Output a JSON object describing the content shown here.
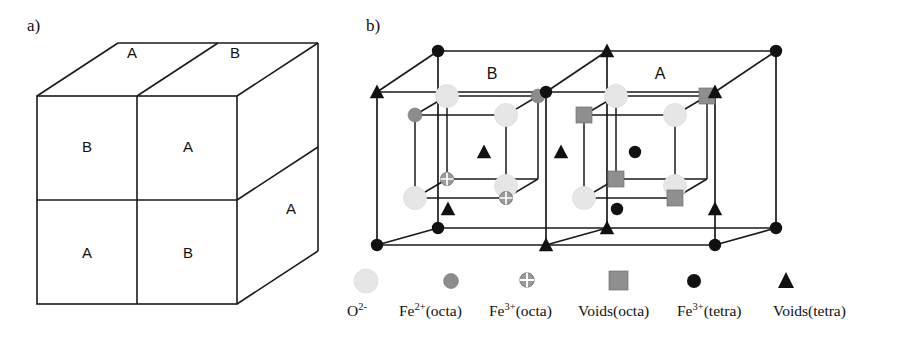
{
  "figure": {
    "panels": [
      {
        "id": "a",
        "label": "a)"
      },
      {
        "id": "b",
        "label": "b)"
      }
    ]
  },
  "panel_a": {
    "label": "a)",
    "description": "stacked-cube-block-diagram",
    "faces": [
      {
        "name": "top-left",
        "label": "A"
      },
      {
        "name": "top-right",
        "label": "B"
      },
      {
        "name": "front-upper-left",
        "label": "B"
      },
      {
        "name": "front-upper-right",
        "label": "A"
      },
      {
        "name": "front-lower-left",
        "label": "A"
      },
      {
        "name": "front-lower-right",
        "label": "B"
      },
      {
        "name": "side-lower",
        "label": "A"
      }
    ]
  },
  "panel_b": {
    "label": "b)",
    "description": "spinel-unit-cell-lattice",
    "region_labels": [
      {
        "name": "left-subcell",
        "label": "B"
      },
      {
        "name": "right-subcell",
        "label": "A"
      }
    ],
    "interior_markers": [
      {
        "name": "voids-tetra-1",
        "symbol": "triangle"
      },
      {
        "name": "voids-tetra-2",
        "symbol": "triangle"
      },
      {
        "name": "fe3-tetra-1",
        "symbol": "circle-black"
      }
    ]
  },
  "legend": {
    "items": [
      {
        "name": "o2-minus",
        "symbol": "circle",
        "color": "#e6e6e6",
        "label_main": "O",
        "label_sup": "2-",
        "label_suffix": "",
        "label_full": "O2-"
      },
      {
        "name": "fe2-octa",
        "symbol": "circle",
        "color": "#8c8c8c",
        "label_main": "Fe",
        "label_sup": "2+",
        "label_suffix": "(octa)",
        "label_full": "Fe2+(octa)"
      },
      {
        "name": "fe3-octa",
        "symbol": "circle-plus",
        "color": "#999999",
        "label_main": "Fe",
        "label_sup": "3+",
        "label_suffix": "(octa)",
        "label_full": "Fe3+(octa)"
      },
      {
        "name": "voids-octa",
        "symbol": "square",
        "color": "#8f8f8f",
        "label_main": "Voids",
        "label_sup": "",
        "label_suffix": "(octa)",
        "label_full": "Voids(octa)"
      },
      {
        "name": "fe3-tetra",
        "symbol": "circle-black",
        "color": "#1a1a1a",
        "label_main": "Fe",
        "label_sup": "3+",
        "label_suffix": "(tetra)",
        "label_full": "Fe3+(tetra)"
      },
      {
        "name": "voids-tetra",
        "symbol": "triangle-black",
        "color": "#1a1a1a",
        "label_main": "Voids",
        "label_sup": "",
        "label_suffix": "(tetra)",
        "label_full": "Voids(tetra)"
      }
    ]
  },
  "colors": {
    "line": "#1a1a1a",
    "o2": "#e6e6e6",
    "fe2_octa": "#8c8c8c",
    "fe3_octa": "#9a9a9a",
    "voids_octa": "#8f8f8f",
    "black": "#111111",
    "background": "#ffffff"
  }
}
